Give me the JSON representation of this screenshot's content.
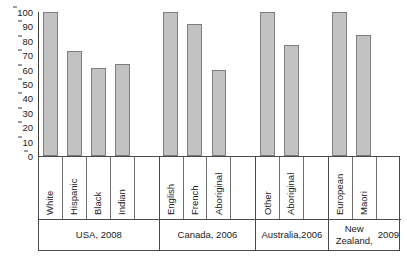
{
  "chart_data": {
    "type": "bar",
    "title": "",
    "subtitle": "",
    "xlabel": "",
    "ylabel": "",
    "ylim": [
      0,
      100
    ],
    "yticks": [
      100,
      90,
      80,
      70,
      60,
      50,
      40,
      30,
      20,
      10,
      0
    ],
    "grid": false,
    "legend": null,
    "bar_fill_color": "#c2c2c2",
    "bar_border_color": "#7d7d7d",
    "axis_color": "#3c3c3c",
    "categories": [
      "White",
      "Hispanic",
      "Black",
      "Indian",
      "English",
      "French",
      "Aboriginal",
      "Other",
      "Aboriginal",
      "European",
      "Maori"
    ],
    "values": [
      100,
      73,
      61,
      64,
      100,
      92,
      60,
      100,
      77,
      100,
      84
    ],
    "groups": [
      {
        "name": "USA, 2008",
        "name_lines": [
          "USA, 2008"
        ],
        "categories": [
          "White",
          "Hispanic",
          "Black",
          "Indian"
        ],
        "values": [
          100,
          73,
          61,
          64
        ],
        "spacer_cells": 1
      },
      {
        "name": "Canada, 2006",
        "name_lines": [
          "Canada, 2006"
        ],
        "categories": [
          "English",
          "French",
          "Aboriginal"
        ],
        "values": [
          100,
          92,
          60
        ],
        "spacer_cells": 1
      },
      {
        "name": "Australia, 2006",
        "name_lines": [
          "Australia,",
          "2006"
        ],
        "categories": [
          "Other",
          "Aboriginal"
        ],
        "values": [
          100,
          77
        ],
        "spacer_cells": 1
      },
      {
        "name": "New Zealand, 2009",
        "name_lines": [
          "New Zealand,",
          "2009"
        ],
        "categories": [
          "European",
          "Maori"
        ],
        "values": [
          100,
          84
        ],
        "spacer_cells": 1
      }
    ]
  }
}
